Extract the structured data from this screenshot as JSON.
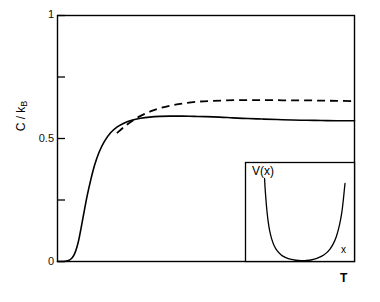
{
  "chart_data": {
    "type": "line",
    "title": "",
    "xlabel": "T",
    "ylabel": "C / k_B",
    "ylabel_main": "C / k",
    "ylabel_sub": "B",
    "xlim": [
      0,
      1
    ],
    "ylim": [
      0,
      1
    ],
    "grid": false,
    "legend": "none",
    "y_ticks": [
      {
        "value": 0,
        "label": "0"
      },
      {
        "value": 0.25,
        "label": ""
      },
      {
        "value": 0.5,
        "label": "0.5"
      },
      {
        "value": 0.75,
        "label": ""
      },
      {
        "value": 1,
        "label": "1"
      }
    ],
    "x_ticks": [],
    "series": [
      {
        "name": "solid-curve",
        "style": "solid",
        "color": "#000000",
        "x": [
          0.0,
          0.022,
          0.037,
          0.048,
          0.057,
          0.065,
          0.072,
          0.08,
          0.09,
          0.1,
          0.112,
          0.125,
          0.14,
          0.158,
          0.178,
          0.2,
          0.225,
          0.25,
          0.28,
          0.31,
          0.345,
          0.38,
          0.42,
          0.46,
          0.5,
          0.545,
          0.59,
          0.64,
          0.69,
          0.74,
          0.79,
          0.84,
          0.89,
          0.94,
          1.0
        ],
        "y": [
          0.0,
          0.0,
          0.004,
          0.013,
          0.03,
          0.057,
          0.09,
          0.14,
          0.205,
          0.268,
          0.332,
          0.392,
          0.444,
          0.488,
          0.522,
          0.546,
          0.563,
          0.574,
          0.582,
          0.587,
          0.59,
          0.591,
          0.591,
          0.59,
          0.589,
          0.587,
          0.584,
          0.581,
          0.579,
          0.577,
          0.575,
          0.574,
          0.573,
          0.572,
          0.572
        ]
      },
      {
        "name": "dashed-curve",
        "style": "dashed",
        "color": "#000000",
        "x": [
          0.2,
          0.225,
          0.25,
          0.28,
          0.315,
          0.35,
          0.39,
          0.43,
          0.475,
          0.52,
          0.57,
          0.62,
          0.67,
          0.72,
          0.775,
          0.83,
          0.885,
          0.94,
          1.0
        ],
        "y": [
          0.522,
          0.548,
          0.57,
          0.592,
          0.611,
          0.625,
          0.636,
          0.644,
          0.65,
          0.653,
          0.655,
          0.656,
          0.656,
          0.656,
          0.655,
          0.655,
          0.654,
          0.653,
          0.652
        ]
      }
    ],
    "inset": {
      "name": "potential-well-inset",
      "type": "line",
      "xlabel": "x",
      "ylabel": "V(x)",
      "style": "solid",
      "color": "#000000",
      "description": "steep flat-bottomed anharmonic potential well",
      "x": [
        0.175,
        0.18,
        0.188,
        0.197,
        0.208,
        0.222,
        0.24,
        0.262,
        0.29,
        0.325,
        0.365,
        0.41,
        0.46,
        0.51,
        0.56,
        0.61,
        0.655,
        0.7,
        0.74,
        0.775,
        0.806,
        0.832,
        0.853,
        0.87,
        0.884,
        0.894,
        0.902,
        0.908,
        0.913
      ],
      "y": [
        1.0,
        0.88,
        0.74,
        0.605,
        0.48,
        0.368,
        0.272,
        0.193,
        0.13,
        0.082,
        0.05,
        0.028,
        0.015,
        0.01,
        0.012,
        0.021,
        0.038,
        0.064,
        0.101,
        0.15,
        0.215,
        0.296,
        0.39,
        0.49,
        0.595,
        0.7,
        0.8,
        0.88,
        0.94
      ]
    }
  }
}
